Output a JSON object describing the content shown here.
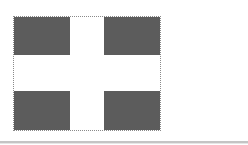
{
  "image": {
    "description": "Flag-like figure: white cross on dark gray field with dotted outline",
    "field_color": "#565656",
    "cross_color": "#ffffff",
    "outline_color": "#8a8a8a",
    "divider_color": "#c4c4c4"
  }
}
